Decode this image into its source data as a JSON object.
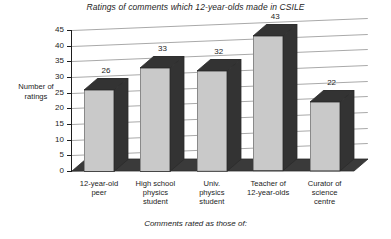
{
  "chart_data": {
    "type": "bar",
    "title": "Ratings of comments which 12-year-olds made in CSILE",
    "xlabel": "Comments rated as those of:",
    "ylabel": "Number of ratings",
    "categories": [
      "12-year-old peer",
      "High school physics student",
      "Univ. physics student",
      "Teacher of 12-year-olds",
      "Curator of science centre"
    ],
    "category_lines": [
      [
        "12-year-old",
        "peer"
      ],
      [
        "High school",
        "physics",
        "student"
      ],
      [
        "Univ.",
        "physics",
        "student"
      ],
      [
        "Teacher of",
        "12-year-olds"
      ],
      [
        "Curator of",
        "science",
        "centre"
      ]
    ],
    "values": [
      26,
      33,
      32,
      43,
      22
    ],
    "value_labels": [
      "26",
      "33",
      "32",
      "43",
      "22"
    ],
    "ylim": [
      0,
      45
    ],
    "ytick_step": 5,
    "ytick_labels": [
      "0",
      "5",
      "10",
      "15",
      "20",
      "25",
      "30",
      "35",
      "40",
      "45"
    ],
    "grid": true,
    "legend": "none",
    "style": "3d-column",
    "colors": {
      "bar_front": "#c9c9c9",
      "bar_side": "#333333",
      "bar_outline": "#2b2b2b",
      "gridline": "#a9a9a9",
      "axis": "#1d1d1d",
      "text": "#1d1d1d",
      "background": "#ffffff"
    }
  }
}
